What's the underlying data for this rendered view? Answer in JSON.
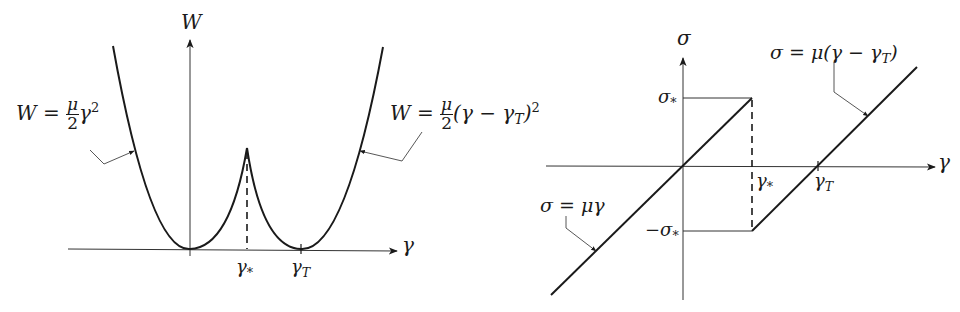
{
  "left_panel": {
    "y_axis_label": "W",
    "x_axis_label": "γ",
    "tick_labels": {
      "gamma_star": {
        "base": "γ",
        "sub": "*"
      },
      "gamma_T": {
        "base": "γ",
        "sub": "T"
      }
    },
    "annotations": {
      "left_curve": {
        "lhs": "W",
        "eq": "=",
        "num": "μ",
        "den": "2",
        "rest": "γ",
        "sup": "2"
      },
      "right_curve": {
        "lhs": "W",
        "eq": "=",
        "num": "μ",
        "den": "2",
        "rest_open": "(γ − γ",
        "rest_sub": "T",
        "rest_close": ")",
        "sup": "2"
      }
    }
  },
  "right_panel": {
    "y_axis_label": "σ",
    "x_axis_label": "γ",
    "tick_labels": {
      "sigma_star": {
        "base": "σ",
        "sub": "*"
      },
      "neg_sigma_star": {
        "base": "−σ",
        "sub": "*"
      },
      "gamma_star": {
        "base": "γ",
        "sub": "*"
      },
      "gamma_T": {
        "base": "γ",
        "sub": "T"
      }
    },
    "annotations": {
      "upper_line": {
        "text": "σ = μ(γ − γ",
        "sub": "T",
        "close": ")"
      },
      "lower_line": {
        "text": "σ = μγ"
      }
    }
  },
  "colors": {
    "ink": "#1a1a1a",
    "background": "#ffffff"
  }
}
